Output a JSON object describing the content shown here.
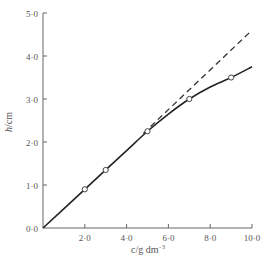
{
  "chart_data": {
    "type": "line",
    "title": "",
    "xlabel": "c/g dm⁻³",
    "ylabel": "h/cm",
    "xlim": [
      0,
      10
    ],
    "ylim": [
      0,
      5
    ],
    "x_ticks": [
      "0·0",
      "2·0",
      "4·0",
      "6·0",
      "8·0",
      "10·0"
    ],
    "y_ticks": [
      "0·0",
      "1·0",
      "2·0",
      "3·0",
      "4·0",
      "5·0"
    ],
    "grid": false,
    "legend": null,
    "series": [
      {
        "name": "measured",
        "style": "solid line with open circle markers",
        "markers": [
          {
            "x": 2.0,
            "y": 0.9
          },
          {
            "x": 3.0,
            "y": 1.35
          },
          {
            "x": 5.0,
            "y": 2.25
          },
          {
            "x": 7.0,
            "y": 3.0
          },
          {
            "x": 9.0,
            "y": 3.5
          }
        ],
        "curve": [
          {
            "x": 0,
            "y": 0
          },
          {
            "x": 2,
            "y": 0.9
          },
          {
            "x": 3,
            "y": 1.35
          },
          {
            "x": 4,
            "y": 1.8
          },
          {
            "x": 5,
            "y": 2.25
          },
          {
            "x": 6,
            "y": 2.65
          },
          {
            "x": 7,
            "y": 3.0
          },
          {
            "x": 8,
            "y": 3.28
          },
          {
            "x": 9,
            "y": 3.5
          },
          {
            "x": 10,
            "y": 3.75
          }
        ]
      },
      {
        "name": "linear extrapolation",
        "style": "dashed line",
        "points": [
          {
            "x": 4.8,
            "y": 2.2
          },
          {
            "x": 10,
            "y": 4.6
          }
        ]
      }
    ]
  },
  "labels": {
    "ylabel_italic": "h",
    "ylabel_unit": "/cm",
    "xlabel_text": "c/g  dm",
    "xlabel_sup": "−3"
  }
}
